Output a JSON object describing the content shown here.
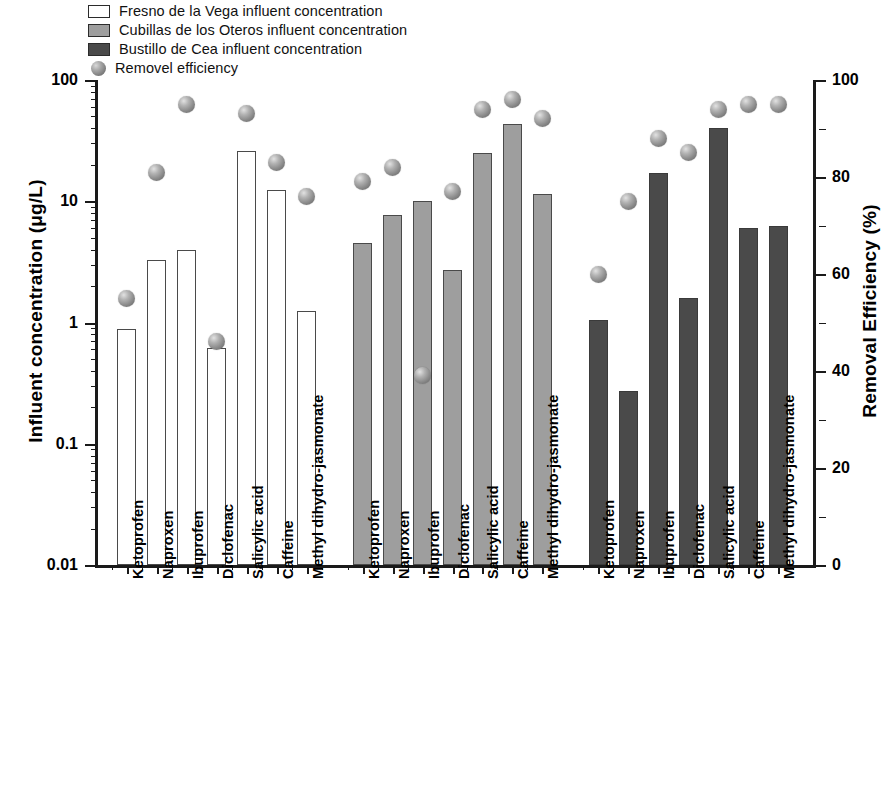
{
  "legend": {
    "items": [
      {
        "label": "Fresno de la Vega influent concentration",
        "type": "swatch",
        "color": "#ffffff",
        "icon": "legend-swatch-white"
      },
      {
        "label": "Cubillas de los Oteros influent concentration",
        "type": "swatch",
        "color": "#9e9e9e",
        "icon": "legend-swatch-gray"
      },
      {
        "label": "Bustillo de Cea influent concentration",
        "type": "swatch",
        "color": "#4a4a4a",
        "icon": "legend-swatch-darkgray"
      },
      {
        "label": "Removel efficiency",
        "type": "sphere",
        "color": "#8a8a8a",
        "icon": "legend-sphere-marker"
      }
    ]
  },
  "chart_data": {
    "type": "bar",
    "title": "",
    "xlabel": "",
    "ylabel": "Influent concentration (μg/L)",
    "y2label": "Removal Efficiency (%)",
    "yscale": "log",
    "ylim": [
      0.01,
      100
    ],
    "yticks": [
      0.01,
      0.1,
      1,
      10,
      100
    ],
    "ytick_labels": [
      "0.01",
      "0.1",
      "1",
      "10",
      "100"
    ],
    "y2lim": [
      0,
      100
    ],
    "y2ticks": [
      0,
      20,
      40,
      60,
      80,
      100
    ],
    "y2tick_labels": [
      "0",
      "20",
      "40",
      "60",
      "80",
      "100"
    ],
    "grid": false,
    "legend_position": "top-left",
    "categories": [
      "Ketoprofen",
      "Naproxen",
      "Ibuprofen",
      "Diclofenac",
      "Salicylic acid",
      "Caffeine",
      "Methyl dihydro-jasmonate"
    ],
    "groups": [
      {
        "name": "Fresno de la Vega",
        "series_concentration": {
          "name": "Fresno de la Vega influent concentration",
          "unit": "μg/L",
          "color": "#ffffff",
          "values": [
            0.88,
            3.3,
            4.0,
            0.62,
            26.0,
            12.5,
            1.25
          ]
        },
        "series_removal": {
          "name": "Removel efficiency",
          "unit": "%",
          "color": "#8a8a8a",
          "values": [
            55,
            81,
            95,
            46,
            93,
            83,
            76
          ]
        }
      },
      {
        "name": "Cubillas de los Oteros",
        "series_concentration": {
          "name": "Cubillas de los Oteros influent concentration",
          "unit": "μg/L",
          "color": "#9e9e9e",
          "values": [
            4.5,
            7.7,
            10.0,
            2.7,
            25.0,
            43.0,
            11.5
          ]
        },
        "series_removal": {
          "name": "Removel efficiency",
          "unit": "%",
          "color": "#8a8a8a",
          "values": [
            79,
            82,
            39,
            77,
            94,
            96,
            92
          ]
        }
      },
      {
        "name": "Bustillo de Cea",
        "series_concentration": {
          "name": "Bustillo de Cea influent concentration",
          "unit": "μg/L",
          "color": "#4a4a4a",
          "values": [
            1.05,
            0.27,
            17.0,
            1.6,
            40.0,
            6.0,
            6.2
          ]
        },
        "series_removal": {
          "name": "Removel efficiency",
          "unit": "%",
          "color": "#8a8a8a",
          "values": [
            60,
            75,
            88,
            85,
            94,
            95,
            95
          ]
        }
      }
    ]
  }
}
